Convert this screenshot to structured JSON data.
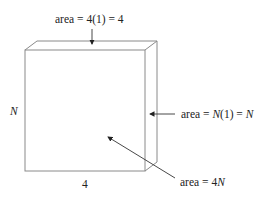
{
  "diagram": {
    "type": "3d-box-surface-areas",
    "labels": {
      "top_face": "area = 4(1) = 4",
      "side_face": "area = N(1) = N",
      "front_face": "area = 4N",
      "height": "N",
      "width": "4"
    },
    "top_face_parts": {
      "prefix": "area = 4(1) = 4"
    },
    "side_face_parts": {
      "prefix": "area = ",
      "var1": "N",
      "mid": "(1) = ",
      "var2": "N"
    },
    "front_face_parts": {
      "prefix": "area = 4",
      "var": "N"
    },
    "colors": {
      "edge": "#8a8a8a",
      "text": "#222222",
      "arrow": "#333333"
    }
  }
}
